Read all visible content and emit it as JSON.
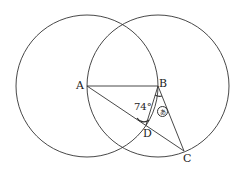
{
  "diagram": {
    "points": {
      "A": {
        "label": "A"
      },
      "B": {
        "label": "B"
      },
      "C": {
        "label": "C"
      },
      "D": {
        "label": "D"
      }
    },
    "angle_label": "74°",
    "unknown_angle_marker": "あ",
    "circles": [
      {
        "center": "A",
        "passes_through": "B"
      },
      {
        "center": "B",
        "passes_through": "A"
      }
    ],
    "segments": [
      "AB",
      "AC",
      "BC",
      "BD"
    ]
  }
}
